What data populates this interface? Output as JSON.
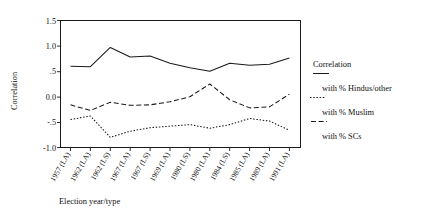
{
  "chart_data": {
    "type": "line",
    "title": "",
    "xlabel": "Election year/type",
    "ylabel": "Correlation",
    "ylim": [
      -1.0,
      1.5
    ],
    "yticks": [
      1.5,
      1.0,
      0.5,
      0.0,
      -0.5,
      -1.0
    ],
    "ytick_labels": [
      "1.5",
      "1.0",
      ".5",
      "0.0",
      "-.5",
      "-1.0"
    ],
    "grid": false,
    "legend_position": "right",
    "categories": [
      "1957 (LA)",
      "1962 (LA)",
      "1962 (LS)",
      "1967 (LA)",
      "1967 (LS)",
      "1969 (LA)",
      "1980 (LS)",
      "1980 (LA)",
      "1984 (LS)",
      "1985 (LA)",
      "1989 (LA)",
      "1991 (LA)"
    ],
    "series": [
      {
        "name": "with % Hindus/other",
        "style": "solid",
        "values": [
          0.6,
          0.59,
          0.97,
          0.78,
          0.8,
          0.66,
          0.57,
          0.5,
          0.66,
          0.62,
          0.64,
          0.76
        ]
      },
      {
        "name": "with % Muslim",
        "style": "dashed",
        "values": [
          -0.16,
          -0.27,
          -0.11,
          -0.17,
          -0.16,
          -0.1,
          0.0,
          0.25,
          -0.06,
          -0.22,
          -0.2,
          0.05
        ]
      },
      {
        "name": "with % SCs",
        "style": "dotted",
        "values": [
          -0.45,
          -0.38,
          -0.8,
          -0.68,
          -0.61,
          -0.58,
          -0.55,
          -0.62,
          -0.55,
          -0.43,
          -0.48,
          -0.66
        ]
      }
    ]
  },
  "axes": {
    "y_title": "Correlation",
    "x_title": "Election year/type",
    "y_tick_labels": [
      "1.5",
      "1.0",
      ".5",
      "0.0",
      "-.5",
      "-1.0"
    ],
    "x_tick_labels": [
      "1957 (LA)",
      "1962 (LA)",
      "1962 (LS)",
      "1967 (LA)",
      "1967 (LS)",
      "1969 (LA)",
      "1980 (LS)",
      "1980 (LA)",
      "1984 (LS)",
      "1985 (LA)",
      "1989 (LA)",
      "1991 (LA)"
    ]
  },
  "legend": {
    "title": "Correlation",
    "entries": [
      {
        "label": "with % Hindus/other",
        "style": "solid"
      },
      {
        "label": "with % Muslim",
        "style": "dotted"
      },
      {
        "label": "with % SCs",
        "style": "dashed"
      }
    ]
  },
  "colors": {
    "ink": "#1a1a1a",
    "background": "#ffffff"
  }
}
